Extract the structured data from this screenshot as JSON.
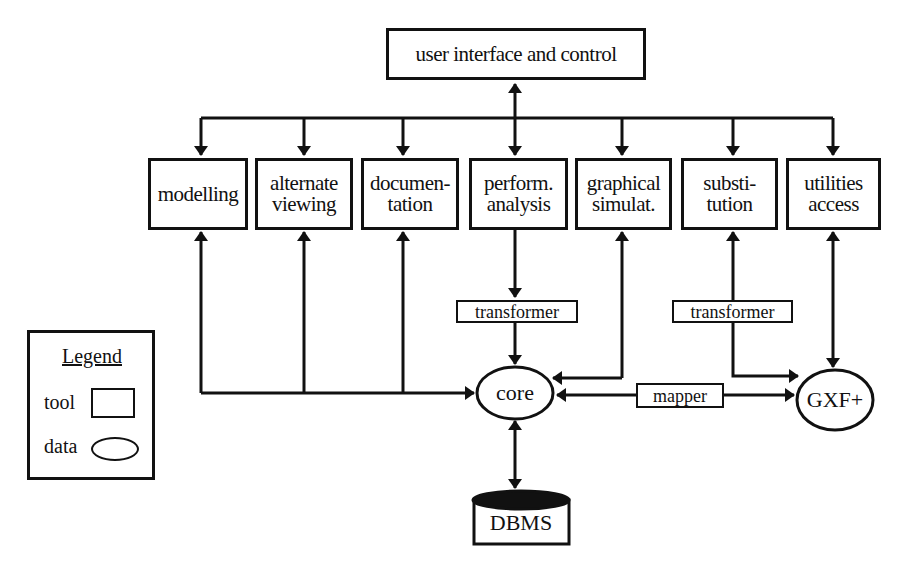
{
  "diagram": {
    "top": {
      "label": "user interface and control"
    },
    "tools": [
      {
        "id": "modelling",
        "lines": [
          "modelling",
          ""
        ]
      },
      {
        "id": "alternate-viewing",
        "lines": [
          "alternate",
          "viewing"
        ]
      },
      {
        "id": "documentation",
        "lines": [
          "documen-",
          "tation"
        ]
      },
      {
        "id": "perform-analysis",
        "lines": [
          "perform.",
          "analysis"
        ]
      },
      {
        "id": "graphical-simulat",
        "lines": [
          "graphical",
          "simulat."
        ]
      },
      {
        "id": "substitution",
        "lines": [
          "substi-",
          "tution"
        ]
      },
      {
        "id": "utilities-access",
        "lines": [
          "utilities",
          "access"
        ]
      }
    ],
    "transformer_left": {
      "label": "transformer"
    },
    "transformer_right": {
      "label": "transformer"
    },
    "mapper": {
      "label": "mapper"
    },
    "core": {
      "label": "core"
    },
    "gxf": {
      "label": "GXF+"
    },
    "dbms": {
      "label": "DBMS"
    },
    "legend": {
      "title": "Legend",
      "tool_label": "tool",
      "data_label": "data"
    }
  }
}
